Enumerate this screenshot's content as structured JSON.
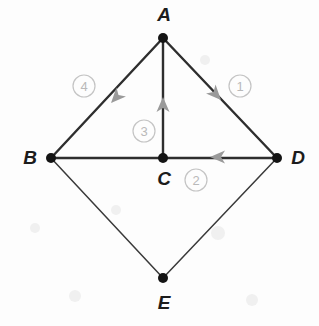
{
  "figure": {
    "background_color": "#fdfdfd",
    "edge_color": "#2e2e2e",
    "arrow_color": "#9a9a9a",
    "number_color": "#bdbdbd",
    "label_color": "#1c1c1c",
    "vertices": [
      {
        "id": "A",
        "label": "A",
        "x": 163,
        "y": 38,
        "label_x": 164,
        "label_y": 21
      },
      {
        "id": "B",
        "label": "B",
        "x": 51,
        "y": 158,
        "label_x": 30,
        "label_y": 164
      },
      {
        "id": "C",
        "label": "C",
        "x": 163,
        "y": 158,
        "label_x": 164,
        "label_y": 185
      },
      {
        "id": "D",
        "label": "D",
        "x": 277,
        "y": 158,
        "label_x": 298,
        "label_y": 164
      },
      {
        "id": "E",
        "label": "E",
        "x": 163,
        "y": 278,
        "label_x": 164,
        "label_y": 309
      }
    ],
    "edges": [
      {
        "id": "edge-a-d",
        "from": "A",
        "to": "D",
        "weight": "thick",
        "directed": true,
        "number": "1"
      },
      {
        "id": "edge-d-c",
        "from": "D",
        "to": "C",
        "weight": "thick",
        "directed": true,
        "number": "2"
      },
      {
        "id": "edge-c-a",
        "from": "C",
        "to": "A",
        "weight": "thick",
        "directed": true,
        "number": "3"
      },
      {
        "id": "edge-a-b",
        "from": "A",
        "to": "B",
        "weight": "thick",
        "directed": true,
        "number": "4"
      },
      {
        "id": "edge-b-c",
        "from": "B",
        "to": "C",
        "weight": "thick",
        "directed": false,
        "number": ""
      },
      {
        "id": "edge-b-e",
        "from": "B",
        "to": "E",
        "weight": "thin",
        "directed": false,
        "number": ""
      },
      {
        "id": "edge-e-d",
        "from": "E",
        "to": "D",
        "weight": "thin",
        "directed": false,
        "number": ""
      }
    ],
    "numbered_markers": [
      {
        "id": "marker-1",
        "text": "1",
        "cx": 240,
        "cy": 86,
        "r": 11
      },
      {
        "id": "marker-2",
        "text": "2",
        "cx": 196,
        "cy": 180,
        "r": 11
      },
      {
        "id": "marker-3",
        "text": "3",
        "cx": 144,
        "cy": 131,
        "r": 11
      },
      {
        "id": "marker-4",
        "text": "4",
        "cx": 84,
        "cy": 86,
        "r": 11
      }
    ],
    "arrow_heads": [
      {
        "id": "arrow-on-edge-1",
        "x": 218,
        "y": 97,
        "angle": 47
      },
      {
        "id": "arrow-on-edge-2",
        "x": 216,
        "y": 157,
        "angle": 180
      },
      {
        "id": "arrow-on-edge-3",
        "x": 163,
        "y": 101,
        "angle": 270
      },
      {
        "id": "arrow-on-edge-4",
        "x": 108,
        "y": 100,
        "angle": 133
      }
    ]
  }
}
